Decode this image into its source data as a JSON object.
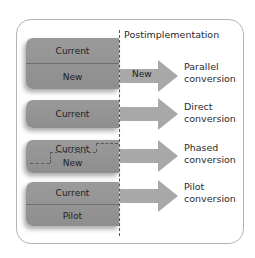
{
  "diagram": {
    "header_label": "Postimplementation",
    "colors": {
      "box_fill": "#949494",
      "arrow_fill": "#a8a8a8",
      "frame_border": "#b4b4b4",
      "text": "#2a2a2a"
    },
    "rows": [
      {
        "box_cells": [
          "Current",
          "New"
        ],
        "arrow_label": "New",
        "method_line1": "Parallel",
        "method_line2": "conversion"
      },
      {
        "box_cells": [
          "Current"
        ],
        "arrow_label": "",
        "method_line1": "Direct",
        "method_line2": "conversion"
      },
      {
        "box_cells": [
          "Current",
          "New"
        ],
        "arrow_label": "",
        "method_line1": "Phased",
        "method_line2": "conversion"
      },
      {
        "box_cells": [
          "Current",
          "Pilot"
        ],
        "arrow_label": "",
        "method_line1": "Pilot",
        "method_line2": "conversion"
      }
    ]
  }
}
